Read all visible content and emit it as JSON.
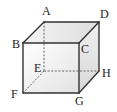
{
  "diagram": {
    "type": "cube",
    "vertices": {
      "A": {
        "label": "A",
        "x": 44,
        "y": 22,
        "lx": 42,
        "ly": 15
      },
      "B": {
        "label": "B",
        "x": 23,
        "y": 43,
        "lx": 12,
        "ly": 48
      },
      "C": {
        "label": "C",
        "x": 79,
        "y": 43,
        "lx": 81,
        "ly": 53
      },
      "D": {
        "label": "D",
        "x": 99,
        "y": 22,
        "lx": 100,
        "ly": 18
      },
      "E": {
        "label": "E",
        "x": 44,
        "y": 71,
        "lx": 34,
        "ly": 72
      },
      "F": {
        "label": "F",
        "x": 23,
        "y": 93,
        "lx": 11,
        "ly": 98
      },
      "G": {
        "label": "G",
        "x": 79,
        "y": 93,
        "lx": 75,
        "ly": 105
      },
      "H": {
        "label": "H",
        "x": 99,
        "y": 71,
        "lx": 102,
        "ly": 77
      }
    },
    "solid_edges": [
      [
        "A",
        "D"
      ],
      [
        "A",
        "B"
      ],
      [
        "B",
        "C"
      ],
      [
        "C",
        "D"
      ],
      [
        "B",
        "F"
      ],
      [
        "F",
        "G"
      ],
      [
        "C",
        "G"
      ],
      [
        "G",
        "H"
      ],
      [
        "D",
        "H"
      ]
    ],
    "hidden_edges": [
      [
        "A",
        "E"
      ],
      [
        "E",
        "F"
      ],
      [
        "E",
        "H"
      ]
    ],
    "colors": {
      "edge": "#333333",
      "hidden": "#555555",
      "front_face": "#eeeeee",
      "top_face": "#e6e6e6",
      "side_face": "#e0e0e0"
    }
  }
}
